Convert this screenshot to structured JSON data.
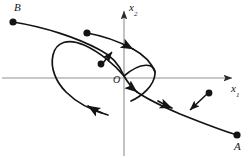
{
  "figure": {
    "kind": "phase-plane-trajectory-diagram",
    "width": 251,
    "height": 158,
    "background_color": "#ffffff",
    "stroke_color": "#141414",
    "axis_color": "#8a8a8a"
  },
  "axes": {
    "horizontal": {
      "name": "x1",
      "label": "x",
      "label_subscript": "1",
      "y_position": 78,
      "x_start": 2,
      "x_end": 236,
      "arrow": "right"
    },
    "vertical": {
      "name": "x2",
      "label": "x",
      "label_subscript": "2",
      "x_position": 124,
      "y_start": 156,
      "y_end": 6,
      "arrow": "up"
    },
    "origin": {
      "label": "O",
      "x": 124,
      "y": 78
    }
  },
  "points": [
    {
      "name": "B",
      "label": "B",
      "x": 13,
      "y": 22,
      "label_position": "above-left"
    },
    {
      "name": "A",
      "label": "A",
      "x": 237,
      "y": 135,
      "label_position": "below"
    },
    {
      "name": "upper-curve-start",
      "label": "",
      "x": 87,
      "y": 33,
      "label_position": "none"
    },
    {
      "name": "inner-arrow-tail",
      "label": "",
      "x": 101,
      "y": 63,
      "label_position": "none"
    },
    {
      "name": "lower-arrow-tail",
      "label": "",
      "x": 209,
      "y": 93,
      "label_position": "none"
    }
  ],
  "curves": [
    {
      "name": "trajectory-B-to-origin",
      "description": "upper trajectory from point B descending rightwards through the x2 axis toward the origin",
      "arrowheads": 1
    },
    {
      "name": "trajectory-origin-to-A",
      "description": "lower trajectory leaving the origin region descending rightwards to point A",
      "arrowheads": 1
    },
    {
      "name": "spiral-loop",
      "description": "closed loop / limit-cycle passing left of the x2 axis, crossing itself near the origin and trailing off to the lower right",
      "arrowheads": 2
    }
  ],
  "annotations": [
    {
      "name": "inner-pointer",
      "description": "short arrow from interior dot to the loop branch"
    },
    {
      "name": "outer-pointer",
      "description": "short arrow from exterior dot to the lower trajectory"
    }
  ]
}
